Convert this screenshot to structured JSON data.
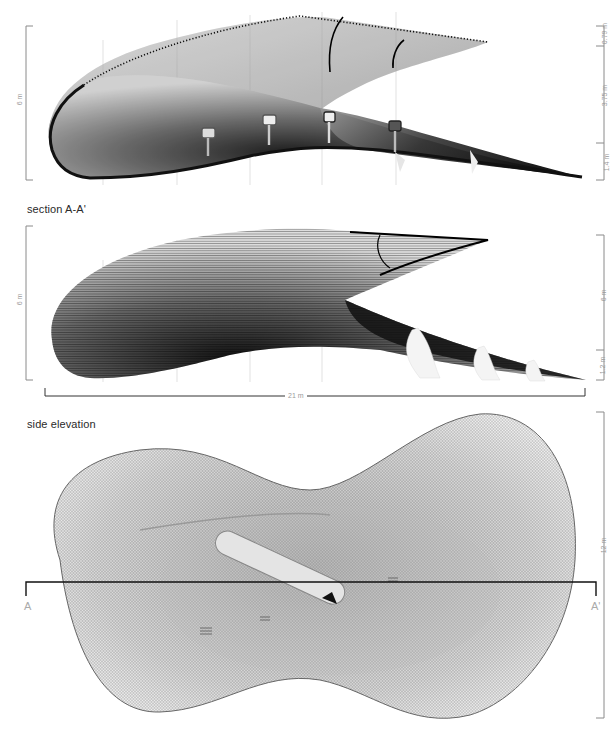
{
  "drawings": [
    {
      "id": "elevation-top",
      "caption": "",
      "dimensions": {
        "left_vertical": "6 m",
        "right_vertical": [
          "0.79 m",
          "3.75 m",
          "1.4 m"
        ]
      },
      "elements": [
        "shell-surface",
        "kiosk-1",
        "kiosk-2",
        "kiosk-3",
        "kiosk-4"
      ]
    },
    {
      "id": "section-a-a",
      "caption": "section A-A'",
      "dimensions": {
        "left_vertical": "6 m",
        "right_vertical": [
          "6 m",
          "1.2 m"
        ],
        "horizontal": "21 m"
      }
    },
    {
      "id": "side-elevation",
      "caption": "side elevation",
      "dimensions": {
        "right_vertical": "12 m"
      },
      "section_markers": {
        "left": "A",
        "right": "A'"
      }
    }
  ],
  "colors": {
    "ink": "#111111",
    "dim_line": "#8a8a8a",
    "dim_text": "#9a9a9a",
    "background": "#ffffff"
  }
}
